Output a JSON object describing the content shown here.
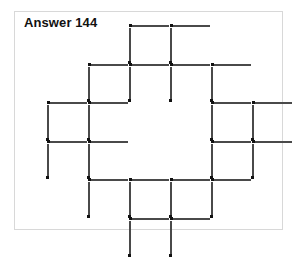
{
  "page": {
    "background_color": "#ffffff",
    "width": 297,
    "height": 241
  },
  "frame": {
    "border_color": "#d8d8d8",
    "background_color": "#ffffff"
  },
  "title": {
    "text": "Answer 144",
    "color": "#111111"
  },
  "figure": {
    "name": "matchstick-diagram",
    "match_color": "#4a4a4a",
    "match_head_color": "#111111",
    "grid": {
      "origin_x": 32,
      "origin_y": 13,
      "cell_width": 41,
      "cell_height": 38.6,
      "cols": 6,
      "rows": 5
    },
    "counts": {
      "horizontal_matches": 20,
      "vertical_matches": 20,
      "total_matches": 40
    },
    "horizontal_matches": [
      {
        "col": 2,
        "row": 0,
        "head": "left"
      },
      {
        "col": 1,
        "row": 1,
        "head": "left"
      },
      {
        "col": 2,
        "row": 1,
        "head": "left"
      },
      {
        "col": 3,
        "row": 1,
        "head": "left"
      },
      {
        "col": 4,
        "row": 1,
        "head": "left"
      },
      {
        "col": 0,
        "row": 2,
        "head": "left"
      },
      {
        "col": 1,
        "row": 2,
        "head": "left"
      },
      {
        "col": 4,
        "row": 2,
        "head": "left"
      },
      {
        "col": 5,
        "row": 2,
        "head": "left"
      },
      {
        "col": 0,
        "row": 3,
        "head": "left"
      },
      {
        "col": 1,
        "row": 3,
        "head": "left"
      },
      {
        "col": 4,
        "row": 3,
        "head": "left"
      },
      {
        "col": 5,
        "row": 3,
        "head": "left"
      },
      {
        "col": 1,
        "row": 4,
        "head": "left"
      },
      {
        "col": 2,
        "row": 4,
        "head": "left"
      },
      {
        "col": 3,
        "row": 4,
        "head": "left"
      },
      {
        "col": 4,
        "row": 4,
        "head": "left"
      },
      {
        "col": 2,
        "row": 5,
        "head": "left"
      },
      {
        "col": 3,
        "row": 0,
        "head": "left"
      },
      {
        "col": 3,
        "row": 5,
        "head": "left"
      }
    ],
    "vertical_matches": [
      {
        "col": 2,
        "row": 0,
        "head": "bottom"
      },
      {
        "col": 3,
        "row": 0,
        "head": "bottom"
      },
      {
        "col": 1,
        "row": 1,
        "head": "bottom"
      },
      {
        "col": 2,
        "row": 1,
        "head": "bottom"
      },
      {
        "col": 3,
        "row": 1,
        "head": "bottom"
      },
      {
        "col": 4,
        "row": 1,
        "head": "bottom"
      },
      {
        "col": 0,
        "row": 2,
        "head": "bottom"
      },
      {
        "col": 1,
        "row": 2,
        "head": "bottom"
      },
      {
        "col": 4,
        "row": 2,
        "head": "bottom"
      },
      {
        "col": 5,
        "row": 2,
        "head": "bottom"
      },
      {
        "col": 0,
        "row": 3,
        "head": "bottom"
      },
      {
        "col": 1,
        "row": 3,
        "head": "bottom"
      },
      {
        "col": 4,
        "row": 3,
        "head": "bottom"
      },
      {
        "col": 5,
        "row": 3,
        "head": "bottom"
      },
      {
        "col": 1,
        "row": 4,
        "head": "bottom"
      },
      {
        "col": 2,
        "row": 4,
        "head": "bottom"
      },
      {
        "col": 3,
        "row": 4,
        "head": "bottom"
      },
      {
        "col": 4,
        "row": 4,
        "head": "bottom"
      },
      {
        "col": 2,
        "row": 5,
        "head": "bottom"
      },
      {
        "col": 3,
        "row": 5,
        "head": "bottom"
      }
    ]
  }
}
